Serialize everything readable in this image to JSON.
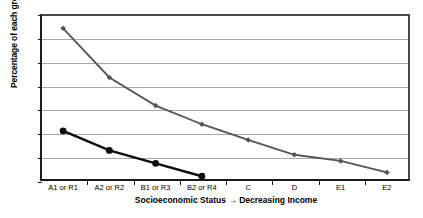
{
  "chart_data": {
    "type": "line",
    "title": "",
    "subtitle": "",
    "xlabel": "Socioeconomic Status → Decreasing Income",
    "ylabel": "Percentage of each group",
    "categories": [
      "A1 or R1",
      "A2 or R2",
      "B1 or R3",
      "B2 or R4",
      "C",
      "D",
      "E1",
      "E2"
    ],
    "ylim": [
      0,
      35
    ],
    "ytick_values": [
      0,
      5,
      10,
      15,
      20,
      25,
      30,
      35
    ],
    "ytick_labels": [
      "0",
      "5",
      "10",
      "15",
      "20",
      "25",
      "30",
      "35"
    ],
    "grid": "horizontal",
    "legend": "none",
    "series": [
      {
        "name": "series-gray",
        "color": "#555555",
        "marker": "diamond",
        "values": [
          32.0,
          21.7,
          15.8,
          11.9,
          8.6,
          5.5,
          4.2,
          1.8
        ]
      },
      {
        "name": "series-black",
        "color": "#0d0d0d",
        "marker": "circle",
        "values": [
          10.5,
          6.4,
          3.7,
          1.0,
          null,
          null,
          null,
          null
        ]
      }
    ]
  }
}
